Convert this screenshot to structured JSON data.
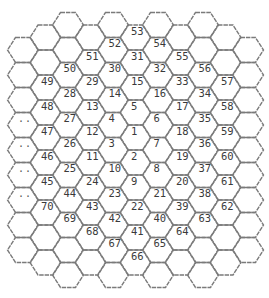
{
  "diagram": {
    "colors": {
      "stroke": "#7a7a7a",
      "text": "#3a3a3a",
      "background": "#ffffff"
    },
    "geometry": {
      "top_half_width": 7.5,
      "slant_width": 8,
      "half_height": 12.5,
      "column_spacing": 22.5
    },
    "columns": [
      {
        "cx": 23,
        "first_cy": 50,
        "cells": [
          "",
          "",
          "",
          "..",
          "..",
          "..",
          "..",
          "",
          ""
        ]
      },
      {
        "cx": 45.5,
        "first_cy": 37.5,
        "cells": [
          "",
          "",
          "49",
          "48",
          "47",
          "46",
          "45",
          "70",
          "",
          ""
        ]
      },
      {
        "cx": 68,
        "first_cy": 25,
        "cells": [
          "",
          "",
          "50",
          "28",
          "27",
          "26",
          "25",
          "44",
          "69",
          "",
          ""
        ]
      },
      {
        "cx": 90.5,
        "first_cy": 37.5,
        "cells": [
          "",
          "51",
          "29",
          "13",
          "12",
          "11",
          "24",
          "43",
          "68",
          ""
        ]
      },
      {
        "cx": 113,
        "first_cy": 25,
        "cells": [
          "",
          "52",
          "30",
          "14",
          "4",
          "3",
          "10",
          "23",
          "42",
          "67",
          ""
        ]
      },
      {
        "cx": 135.5,
        "first_cy": 37.5,
        "cells": [
          "53",
          "31",
          "15",
          "5",
          "1",
          "2",
          "9",
          "22",
          "41",
          "66"
        ]
      },
      {
        "cx": 158,
        "first_cy": 25,
        "cells": [
          "",
          "54",
          "32",
          "16",
          "6",
          "7",
          "8",
          "21",
          "40",
          "65",
          ""
        ]
      },
      {
        "cx": 180.5,
        "first_cy": 37.5,
        "cells": [
          "",
          "55",
          "33",
          "17",
          "18",
          "19",
          "20",
          "39",
          "64",
          ""
        ]
      },
      {
        "cx": 203,
        "first_cy": 25,
        "cells": [
          "",
          "",
          "56",
          "34",
          "35",
          "36",
          "37",
          "38",
          "63",
          "",
          ""
        ]
      },
      {
        "cx": 225.5,
        "first_cy": 37.5,
        "cells": [
          "",
          "",
          "57",
          "58",
          "59",
          "60",
          "61",
          "62",
          "",
          ""
        ]
      },
      {
        "cx": 248,
        "first_cy": 50,
        "cells": [
          "",
          "",
          "",
          "",
          "",
          "",
          "",
          "",
          ""
        ]
      }
    ]
  }
}
